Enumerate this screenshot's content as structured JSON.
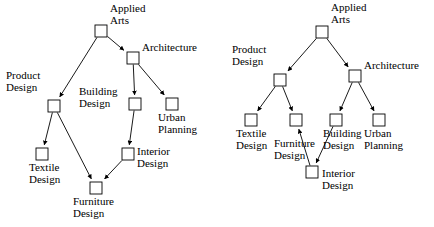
{
  "figure": {
    "title": "",
    "background_color": "#ffffff",
    "stroke_color": "#000000",
    "node_fill_color": "#ffffff",
    "node_size": 12
  },
  "diagrams": [
    {
      "id": "left",
      "name": "applied-arts-dag-left",
      "nodes": [
        {
          "id": "applied_arts",
          "label_line1": "Applied",
          "label_line2": "Arts",
          "x": 101,
          "y": 31,
          "label_x": 110,
          "label_y": 3,
          "align": "left"
        },
        {
          "id": "architecture",
          "label_line1": "Architecture",
          "label_line2": "",
          "x": 133,
          "y": 58,
          "label_x": 142,
          "label_y": 42,
          "align": "left"
        },
        {
          "id": "product_design",
          "label_line1": "Product",
          "label_line2": "Design",
          "x": 54,
          "y": 106,
          "label_x": 6,
          "label_y": 70,
          "align": "left"
        },
        {
          "id": "building_design",
          "label_line1": "Building",
          "label_line2": "Design",
          "x": 135,
          "y": 104,
          "label_x": 79,
          "label_y": 86,
          "align": "left"
        },
        {
          "id": "urban_planning",
          "label_line1": "Urban",
          "label_line2": "Planning",
          "x": 172,
          "y": 104,
          "label_x": 158,
          "label_y": 112,
          "align": "left"
        },
        {
          "id": "textile_design",
          "label_line1": "Textile",
          "label_line2": "Design",
          "x": 42,
          "y": 154,
          "label_x": 29,
          "label_y": 162,
          "align": "left"
        },
        {
          "id": "interior_design",
          "label_line1": "Interior",
          "label_line2": "Design",
          "x": 128,
          "y": 154,
          "label_x": 137,
          "label_y": 146,
          "align": "left"
        },
        {
          "id": "furniture_design",
          "label_line1": "Furniture",
          "label_line2": "Design",
          "x": 96,
          "y": 188,
          "label_x": 73,
          "label_y": 196,
          "align": "left"
        }
      ],
      "edges": [
        {
          "from": "applied_arts",
          "to": "product_design"
        },
        {
          "from": "applied_arts",
          "to": "architecture"
        },
        {
          "from": "architecture",
          "to": "building_design"
        },
        {
          "from": "architecture",
          "to": "urban_planning"
        },
        {
          "from": "product_design",
          "to": "textile_design"
        },
        {
          "from": "product_design",
          "to": "furniture_design"
        },
        {
          "from": "building_design",
          "to": "interior_design"
        },
        {
          "from": "interior_design",
          "to": "furniture_design"
        }
      ]
    },
    {
      "id": "right",
      "name": "applied-arts-dag-right",
      "nodes": [
        {
          "id": "applied_arts",
          "label_line1": "Applied",
          "label_line2": "Arts",
          "x": 322,
          "y": 32,
          "label_x": 331,
          "label_y": 2,
          "align": "left"
        },
        {
          "id": "product_design",
          "label_line1": "Product",
          "label_line2": "Design",
          "x": 280,
          "y": 80,
          "label_x": 232,
          "label_y": 44,
          "align": "left"
        },
        {
          "id": "architecture",
          "label_line1": "Architecture",
          "label_line2": "",
          "x": 355,
          "y": 76,
          "label_x": 364,
          "label_y": 60,
          "align": "left"
        },
        {
          "id": "textile_design",
          "label_line1": "Textile",
          "label_line2": "Design",
          "x": 251,
          "y": 120,
          "label_x": 236,
          "label_y": 128,
          "align": "left"
        },
        {
          "id": "furniture_design",
          "label_line1": "Furniture",
          "label_line2": "Design",
          "x": 296,
          "y": 120,
          "label_x": 274,
          "label_y": 138,
          "align": "left"
        },
        {
          "id": "building_design",
          "label_line1": "Building",
          "label_line2": "Design",
          "x": 336,
          "y": 120,
          "label_x": 323,
          "label_y": 128,
          "align": "left"
        },
        {
          "id": "urban_planning",
          "label_line1": "Urban",
          "label_line2": "Planning",
          "x": 379,
          "y": 120,
          "label_x": 364,
          "label_y": 128,
          "align": "left"
        },
        {
          "id": "interior_design",
          "label_line1": "Interior",
          "label_line2": "Design",
          "x": 312,
          "y": 172,
          "label_x": 322,
          "label_y": 168,
          "align": "left"
        }
      ],
      "edges": [
        {
          "from": "applied_arts",
          "to": "product_design"
        },
        {
          "from": "applied_arts",
          "to": "architecture"
        },
        {
          "from": "product_design",
          "to": "textile_design"
        },
        {
          "from": "product_design",
          "to": "furniture_design"
        },
        {
          "from": "architecture",
          "to": "building_design"
        },
        {
          "from": "architecture",
          "to": "urban_planning"
        },
        {
          "from": "building_design",
          "to": "interior_design"
        },
        {
          "from": "interior_design",
          "to": "furniture_design"
        }
      ]
    }
  ]
}
